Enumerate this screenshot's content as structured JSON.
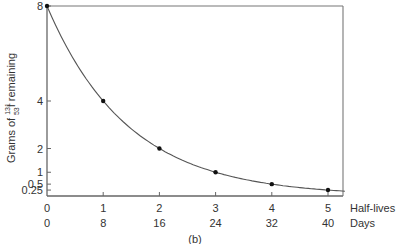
{
  "caption": "(b)",
  "chart_data": {
    "type": "line",
    "title": "",
    "ylabel": "Grams of 131 53 I remaining",
    "ylabel_parts": {
      "prefix": "Grams of ",
      "mass": "131",
      "atomic": "53",
      "element": "I",
      "suffix": " remaining"
    },
    "xlabel_rows": [
      "Half-lives",
      "Days"
    ],
    "x_halflives": [
      0,
      1,
      2,
      3,
      4,
      5
    ],
    "x_days": [
      0,
      8,
      16,
      24,
      32,
      40
    ],
    "y_ticks": [
      "8",
      "4",
      "2",
      "1",
      "0.5",
      "0.25"
    ],
    "series": [
      {
        "name": "Iodine-131 remaining",
        "x": [
          0,
          1,
          2,
          3,
          4,
          5
        ],
        "values": [
          8,
          4,
          2,
          1,
          0.5,
          0.25
        ]
      }
    ],
    "ylim": [
      0,
      8
    ],
    "xlim": [
      0,
      5.3
    ],
    "grid": false,
    "legend": "none"
  }
}
